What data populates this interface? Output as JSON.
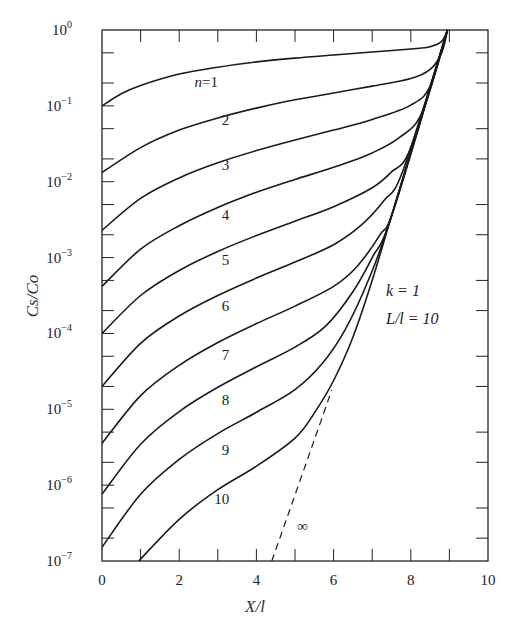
{
  "chart_data": {
    "type": "line",
    "title": "",
    "xlabel": "X/l",
    "ylabel": "Cs/Co",
    "xlim": [
      0,
      10
    ],
    "ylim": [
      1e-07,
      1
    ],
    "yscale": "log",
    "grid": false,
    "x_ticks": [
      0,
      2,
      4,
      6,
      8,
      10
    ],
    "x_tick_labels": [
      "0",
      "2",
      "4",
      "6",
      "8",
      "10"
    ],
    "y_ticks": [
      1,
      0.1,
      0.01,
      0.001,
      0.0001,
      1e-05,
      1e-06,
      1e-07
    ],
    "y_tick_labels": [
      {
        "base": "10",
        "exp": "0"
      },
      {
        "base": "10",
        "exp": "−1"
      },
      {
        "base": "10",
        "exp": "−2"
      },
      {
        "base": "10",
        "exp": "−3"
      },
      {
        "base": "10",
        "exp": "−4"
      },
      {
        "base": "10",
        "exp": "−5"
      },
      {
        "base": "10",
        "exp": "−6"
      },
      {
        "base": "10",
        "exp": "−7"
      }
    ],
    "annotations": [
      {
        "text": "k = 1",
        "x": 7.5,
        "y_log": -3.7
      },
      {
        "text": "L/l = 10",
        "x": 7.5,
        "y_log": -4.1
      },
      {
        "text": "∞",
        "x": 5.2,
        "y_log": -6.6
      }
    ],
    "series": [
      {
        "name": "n=1",
        "label": "n=1",
        "label_pos": [
          2.7,
          -0.75
        ],
        "style": "solid",
        "points_log10": [
          [
            0,
            -1.0
          ],
          [
            0.5,
            -0.84
          ],
          [
            1,
            -0.73
          ],
          [
            2,
            -0.58
          ],
          [
            3,
            -0.49
          ],
          [
            4,
            -0.42
          ],
          [
            5,
            -0.37
          ],
          [
            6,
            -0.33
          ],
          [
            7,
            -0.29
          ],
          [
            8,
            -0.25
          ],
          [
            8.5,
            -0.22
          ],
          [
            8.8,
            -0.15
          ],
          [
            8.95,
            0
          ]
        ]
      },
      {
        "name": "n=2",
        "label": "2",
        "label_pos": [
          3.2,
          -1.25
        ],
        "style": "solid",
        "points_log10": [
          [
            0,
            -1.88
          ],
          [
            1,
            -1.55
          ],
          [
            2,
            -1.32
          ],
          [
            3,
            -1.16
          ],
          [
            4,
            -1.03
          ],
          [
            5,
            -0.92
          ],
          [
            6,
            -0.83
          ],
          [
            7,
            -0.74
          ],
          [
            8,
            -0.64
          ],
          [
            8.5,
            -0.52
          ],
          [
            8.8,
            -0.3
          ],
          [
            8.95,
            0
          ]
        ]
      },
      {
        "name": "n=3",
        "label": "3",
        "label_pos": [
          3.2,
          -1.85
        ],
        "style": "solid",
        "points_log10": [
          [
            0,
            -2.64
          ],
          [
            1,
            -2.22
          ],
          [
            2,
            -1.95
          ],
          [
            3,
            -1.75
          ],
          [
            4,
            -1.59
          ],
          [
            5,
            -1.45
          ],
          [
            6,
            -1.32
          ],
          [
            7,
            -1.18
          ],
          [
            8,
            -0.99
          ],
          [
            8.5,
            -0.74
          ],
          [
            8.95,
            0
          ]
        ]
      },
      {
        "name": "n=4",
        "label": "4",
        "label_pos": [
          3.2,
          -2.5
        ],
        "style": "solid",
        "points_log10": [
          [
            0,
            -3.38
          ],
          [
            1,
            -2.89
          ],
          [
            2,
            -2.58
          ],
          [
            3,
            -2.34
          ],
          [
            4,
            -2.14
          ],
          [
            5,
            -1.97
          ],
          [
            6,
            -1.81
          ],
          [
            7,
            -1.62
          ],
          [
            7.7,
            -1.42
          ],
          [
            8.3,
            -1.08
          ],
          [
            8.95,
            0
          ]
        ]
      },
      {
        "name": "n=5",
        "label": "5",
        "label_pos": [
          3.2,
          -3.1
        ],
        "style": "solid",
        "points_log10": [
          [
            0,
            -4.0
          ],
          [
            1,
            -3.5
          ],
          [
            2,
            -3.17
          ],
          [
            3,
            -2.92
          ],
          [
            4,
            -2.71
          ],
          [
            5,
            -2.52
          ],
          [
            6,
            -2.33
          ],
          [
            7,
            -2.08
          ],
          [
            7.5,
            -1.87
          ],
          [
            8.0,
            -1.55
          ],
          [
            8.95,
            0
          ]
        ]
      },
      {
        "name": "n=6",
        "label": "6",
        "label_pos": [
          3.2,
          -3.7
        ],
        "style": "solid",
        "points_log10": [
          [
            0,
            -4.7
          ],
          [
            1,
            -4.13
          ],
          [
            2,
            -3.77
          ],
          [
            3,
            -3.5
          ],
          [
            4,
            -3.27
          ],
          [
            5,
            -3.06
          ],
          [
            6,
            -2.83
          ],
          [
            6.7,
            -2.58
          ],
          [
            7.3,
            -2.25
          ],
          [
            7.8,
            -1.85
          ],
          [
            8.95,
            0
          ]
        ]
      },
      {
        "name": "n=7",
        "label": "7",
        "label_pos": [
          3.2,
          -4.35
        ],
        "style": "solid",
        "points_log10": [
          [
            0,
            -5.45
          ],
          [
            1,
            -4.82
          ],
          [
            2,
            -4.42
          ],
          [
            3,
            -4.12
          ],
          [
            4,
            -3.87
          ],
          [
            5,
            -3.64
          ],
          [
            6,
            -3.38
          ],
          [
            6.6,
            -3.12
          ],
          [
            7.2,
            -2.7
          ],
          [
            7.6,
            -2.3
          ],
          [
            8.95,
            0
          ]
        ]
      },
      {
        "name": "n=8",
        "label": "8",
        "label_pos": [
          3.2,
          -4.95
        ],
        "style": "solid",
        "points_log10": [
          [
            0,
            -6.12
          ],
          [
            1,
            -5.46
          ],
          [
            2,
            -5.03
          ],
          [
            3,
            -4.71
          ],
          [
            4,
            -4.44
          ],
          [
            5,
            -4.18
          ],
          [
            5.8,
            -3.9
          ],
          [
            6.5,
            -3.45
          ],
          [
            7.0,
            -3.0
          ],
          [
            7.5,
            -2.45
          ],
          [
            8.95,
            0
          ]
        ]
      },
      {
        "name": "n=9",
        "label": "9",
        "label_pos": [
          3.2,
          -5.6
        ],
        "style": "solid",
        "points_log10": [
          [
            0,
            -6.82
          ],
          [
            1,
            -6.12
          ],
          [
            2,
            -5.66
          ],
          [
            3,
            -5.32
          ],
          [
            4,
            -5.04
          ],
          [
            5,
            -4.74
          ],
          [
            5.7,
            -4.4
          ],
          [
            6.3,
            -3.95
          ],
          [
            6.9,
            -3.3
          ],
          [
            7.5,
            -2.45
          ],
          [
            8.95,
            0
          ]
        ]
      },
      {
        "name": "n=10",
        "label": "10",
        "label_pos": [
          3.1,
          -6.25
        ],
        "style": "solid",
        "points_log10": [
          [
            0.95,
            -7.0
          ],
          [
            2,
            -6.45
          ],
          [
            3,
            -6.06
          ],
          [
            4,
            -5.75
          ],
          [
            5,
            -5.38
          ],
          [
            5.5,
            -5.05
          ],
          [
            6.0,
            -4.62
          ],
          [
            6.5,
            -4.05
          ],
          [
            7.0,
            -3.3
          ],
          [
            7.5,
            -2.45
          ],
          [
            8.95,
            0
          ]
        ]
      },
      {
        "name": "n=∞",
        "label": "∞",
        "label_pos": [
          5.2,
          -6.6
        ],
        "style": "dashed",
        "points_log10": [
          [
            4.4,
            -7.0
          ],
          [
            5.95,
            -4.75
          ]
        ]
      }
    ]
  }
}
